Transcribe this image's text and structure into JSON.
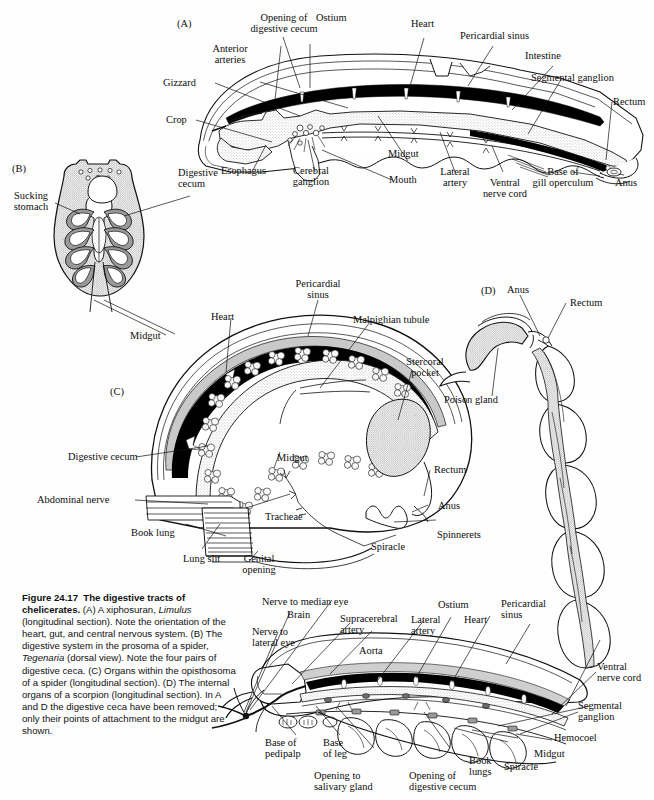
{
  "figure": {
    "number": "Figure 24.17",
    "title": "The digestive tracts of chelicerates.",
    "caption_rest": " (A) A xiphosuran, ",
    "taxon_a": "Limulus",
    "caption_2": " (longitudinal section). Note the orientation of the heart, gut, and central nervous system. (B) The digestive system in the prosoma of a spider, ",
    "taxon_b": "Tegenaria",
    "caption_3": " (dorsal view). Note the four pairs of digestive ceca. (C) Organs within the opisthosoma of a spider (longitudinal section). (D) The internal organs of a scorpion (longitudinal section). In A and D the digestive ceca have been removed; only their points of attachment to the midgut are shown."
  },
  "colors": {
    "ink": "#111111",
    "heart_fill": "#000000",
    "gut_stipple": "#d8d6d2",
    "cecum_gray": "#8d8d8d",
    "paper": "#fefefe"
  },
  "panels": {
    "a": {
      "id": "(A)",
      "subject": "Limulus longitudinal section",
      "labels": [
        {
          "key": "opening_of_digestive_cecum",
          "text": "Opening of\ndigestive cecum"
        },
        {
          "key": "ostium",
          "text": "Ostium"
        },
        {
          "key": "heart",
          "text": "Heart"
        },
        {
          "key": "pericardial_sinus",
          "text": "Pericardial sinus"
        },
        {
          "key": "intestine",
          "text": "Intestine"
        },
        {
          "key": "segmental_ganglion",
          "text": "Segmental ganglion"
        },
        {
          "key": "rectum",
          "text": "Rectum"
        },
        {
          "key": "anterior_arteries",
          "text": "Anterior\narteries"
        },
        {
          "key": "gizzard",
          "text": "Gizzard"
        },
        {
          "key": "crop",
          "text": "Crop"
        },
        {
          "key": "esophagus",
          "text": "Esophagus"
        },
        {
          "key": "cerebral_ganglion",
          "text": "Cerebral\nganglion"
        },
        {
          "key": "midgut",
          "text": "Midgut"
        },
        {
          "key": "mouth",
          "text": "Mouth"
        },
        {
          "key": "lateral_artery",
          "text": "Lateral\nartery"
        },
        {
          "key": "ventral_nerve_cord",
          "text": "Ventral\nnerve cord"
        },
        {
          "key": "base_of_gill_operculum",
          "text": "Base of\ngill operculum"
        },
        {
          "key": "anus",
          "text": "Anus"
        }
      ]
    },
    "b": {
      "id": "(B)",
      "subject": "Tegenaria prosoma dorsal view",
      "labels": [
        {
          "key": "sucking_stomach",
          "text": "Sucking\nstomach"
        },
        {
          "key": "digestive_cecum",
          "text": "Digestive\ncecum"
        },
        {
          "key": "midgut",
          "text": "Midgut"
        }
      ]
    },
    "c": {
      "id": "(C)",
      "subject": "Spider opisthosoma longitudinal section",
      "labels": [
        {
          "key": "pericardial_sinus",
          "text": "Pericardial\nsinus"
        },
        {
          "key": "heart",
          "text": "Heart"
        },
        {
          "key": "malpighian_tubule",
          "text": "Malpighian tubule"
        },
        {
          "key": "stercoral_pocket",
          "text": "Stercoral\npocket"
        },
        {
          "key": "digestive_cecum",
          "text": "Digestive cecum"
        },
        {
          "key": "midgut",
          "text": "Midgut"
        },
        {
          "key": "rectum",
          "text": "Rectum"
        },
        {
          "key": "anus",
          "text": "Anus"
        },
        {
          "key": "spinnerets",
          "text": "Spinnerets"
        },
        {
          "key": "abdominal_nerve",
          "text": "Abdominal nerve"
        },
        {
          "key": "book_lung",
          "text": "Book lung"
        },
        {
          "key": "lung_slit",
          "text": "Lung slit"
        },
        {
          "key": "genital_opening",
          "text": "Genital\nopening"
        },
        {
          "key": "tracheae",
          "text": "Tracheae"
        },
        {
          "key": "spiracle",
          "text": "Spiracle"
        }
      ]
    },
    "d": {
      "id": "(D)",
      "subject": "Scorpion longitudinal section",
      "labels": [
        {
          "key": "anus",
          "text": "Anus"
        },
        {
          "key": "rectum",
          "text": "Rectum"
        },
        {
          "key": "poison_gland",
          "text": "Poison gland"
        },
        {
          "key": "nerve_to_median_eye",
          "text": "Nerve to median eye"
        },
        {
          "key": "brain",
          "text": "Brain"
        },
        {
          "key": "nerve_to_lateral_eye",
          "text": "Nerve to\nlateral eye"
        },
        {
          "key": "supracerebral_artery",
          "text": "Supracerebral\nartery"
        },
        {
          "key": "aorta",
          "text": "Aorta"
        },
        {
          "key": "lateral_artery",
          "text": "Lateral\nartery"
        },
        {
          "key": "ostium",
          "text": "Ostium"
        },
        {
          "key": "heart",
          "text": "Heart"
        },
        {
          "key": "pericardial_sinus",
          "text": "Pericardial\nsinus"
        },
        {
          "key": "ventral_nerve_cord",
          "text": "Ventral\nnerve cord"
        },
        {
          "key": "segmental_ganglion",
          "text": "Segmental\nganglion"
        },
        {
          "key": "hemocoel",
          "text": "Hemocoel"
        },
        {
          "key": "midgut",
          "text": "Midgut"
        },
        {
          "key": "spiracle",
          "text": "Spiracle"
        },
        {
          "key": "book_lungs",
          "text": "Book\nlungs"
        },
        {
          "key": "opening_of_digestive_cecum",
          "text": "Opening of\ndigestive cecum"
        },
        {
          "key": "opening_to_salivary_gland",
          "text": "Opening to\nsalivary gland"
        },
        {
          "key": "base_of_leg",
          "text": "Base\nof leg"
        },
        {
          "key": "base_of_pedipalp",
          "text": "Base of\npedipalp"
        }
      ]
    }
  }
}
